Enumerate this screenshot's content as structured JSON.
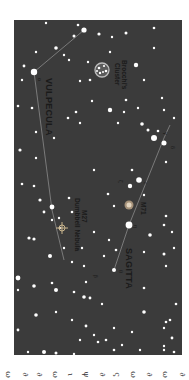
{
  "chart": {
    "background": "#3b3b3b",
    "star_color": "#ffffff",
    "line_color": "#8a8a8a",
    "constellations": [
      {
        "name": "VULPECULA"
      },
      {
        "name": "SAGITTA"
      }
    ],
    "objects": [
      {
        "id": "brocchi",
        "label_line1": "Brocchi's",
        "label_line2": "Cluster"
      },
      {
        "id": "m27",
        "label_line1": "M27",
        "label_line2": "Dumbbell Nebula"
      },
      {
        "id": "m71",
        "label_line1": "M71"
      }
    ],
    "greek_labels": [
      "α",
      "γ",
      "δ",
      "ε",
      "ζ",
      "η",
      "θ",
      "β",
      "α"
    ]
  },
  "caption": {
    "fragments": [
      "ω",
      "∂",
      "∂",
      "ω",
      "ι",
      "ψ",
      "∂",
      "ς",
      "ω",
      "∂",
      "ω",
      "∂"
    ]
  }
}
